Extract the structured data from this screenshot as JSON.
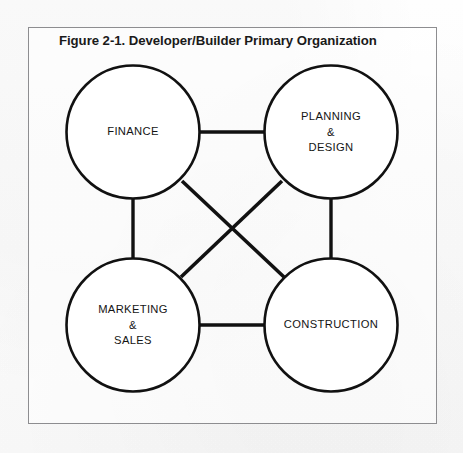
{
  "figure": {
    "title": "Figure 2-1. Developer/Builder Primary Organization",
    "frame_color": "#8d8d90",
    "ink_color": "#111111",
    "background_color": "#fdfdfd"
  },
  "diagram": {
    "type": "node-link",
    "shape": "circle",
    "layout": "2x2 grid",
    "nodes": [
      {
        "id": "finance",
        "label": "FINANCE",
        "cx": 133,
        "cy": 132,
        "r": 67
      },
      {
        "id": "planning",
        "label": "PLANNING\n&\nDESIGN",
        "cx": 331,
        "cy": 132,
        "r": 67
      },
      {
        "id": "marketing",
        "label": "MARKETING\n&\nSALES",
        "cx": 133,
        "cy": 325,
        "r": 67
      },
      {
        "id": "construction",
        "label": "CONSTRUCTION",
        "cx": 331,
        "cy": 325,
        "r": 67
      }
    ],
    "edges": [
      {
        "id": "finance-planning",
        "from": "finance",
        "to": "planning"
      },
      {
        "id": "finance-marketing",
        "from": "finance",
        "to": "marketing"
      },
      {
        "id": "planning-construction",
        "from": "planning",
        "to": "construction"
      },
      {
        "id": "marketing-construction",
        "from": "marketing",
        "to": "construction"
      },
      {
        "id": "finance-construction",
        "from": "finance",
        "to": "construction"
      },
      {
        "id": "planning-marketing",
        "from": "planning",
        "to": "marketing"
      }
    ]
  }
}
